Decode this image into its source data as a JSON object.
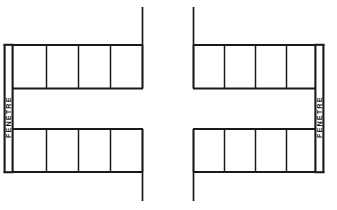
{
  "figure": {
    "title": "",
    "background_color": "#ffffff",
    "line_color": "#1a1a1a",
    "width": 337,
    "height": 210
  },
  "diagrams": [
    {
      "id": "left-arrangement",
      "orientation": "window-on-left",
      "window_label": "FENÊTRE",
      "window_label_side": "left",
      "rows": [
        {
          "id": "left-top-row",
          "position": "top",
          "cell_count": 4,
          "cells": [
            "",
            "",
            "",
            ""
          ]
        },
        {
          "id": "left-bottom-row",
          "position": "bottom",
          "cell_count": 4,
          "cells": [
            "",
            "",
            "",
            ""
          ]
        }
      ],
      "open_side": "right",
      "extension_lines": 2
    },
    {
      "id": "right-arrangement",
      "orientation": "window-on-right",
      "window_label": "FENÊTRE",
      "window_label_side": "right",
      "rows": [
        {
          "id": "right-top-row",
          "position": "top",
          "cell_count": 4,
          "cells": [
            "",
            "",
            "",
            ""
          ]
        },
        {
          "id": "right-bottom-row",
          "position": "bottom",
          "cell_count": 4,
          "cells": [
            "",
            "",
            "",
            ""
          ]
        }
      ],
      "open_side": "left",
      "extension_lines": 2
    }
  ],
  "labels": {
    "window_left": "FENÊTRE",
    "window_right": "FENÊTRE"
  }
}
